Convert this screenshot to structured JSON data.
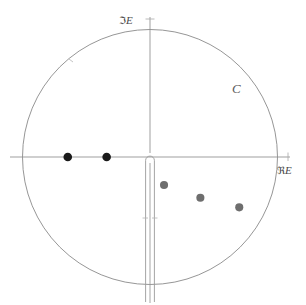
{
  "figure": {
    "background_color": "#ffffff",
    "line_color": "#8a8a8a",
    "axis_color": "#909090"
  },
  "labels": {
    "imaginary_axis": "E",
    "imaginary_axis_prefix": "ℑ",
    "real_axis": "E",
    "real_axis_prefix": "ℜ",
    "contour": "C"
  },
  "chart_data": {
    "type": "scatter",
    "xlabel": "ℜE",
    "ylabel": "ℑE",
    "xlim": [
      -1.1,
      1.1
    ],
    "ylim": [
      -1.1,
      1.1
    ],
    "grid": false,
    "legend": "none",
    "annotations": [
      {
        "text": "C",
        "x": 0.6,
        "y": 0.62,
        "note": "contour label near circle arc in upper right quadrant"
      },
      {
        "text": "ℑE",
        "x": -0.1,
        "y": 1.1,
        "note": "imaginary axis label at top"
      },
      {
        "text": "ℜE",
        "x": 1.12,
        "y": -0.12,
        "note": "real axis label at right"
      }
    ],
    "shapes": [
      {
        "kind": "circle",
        "name": "contour-C",
        "center": [
          0,
          0
        ],
        "radius": 1.0,
        "filled": false,
        "stroke": "#8a8a8a"
      },
      {
        "kind": "branch-cut",
        "name": "negative-imaginary-branch-cut",
        "from": [
          0,
          0
        ],
        "to": [
          0,
          -1.12
        ],
        "style": "narrow slit with rounded cap at origin, two parallel rails",
        "ticks_at": [
          -0.48
        ]
      },
      {
        "kind": "axis",
        "name": "real-axis",
        "from": [
          -1.1,
          0
        ],
        "to": [
          1.08,
          0
        ]
      },
      {
        "kind": "axis",
        "name": "imaginary-axis",
        "from": [
          0,
          -1.12
        ],
        "to": [
          0,
          1.06
        ]
      }
    ],
    "series": [
      {
        "name": "bound-state-poles",
        "marker": "filled circle",
        "color": "#1a1a1a",
        "size": 8,
        "points": [
          {
            "x": -0.645,
            "y": 0.0
          },
          {
            "x": -0.34,
            "y": 0.0
          }
        ]
      },
      {
        "name": "resonance-poles",
        "marker": "filled circle",
        "color": "#6e6e6e",
        "size": 7.5,
        "points": [
          {
            "x": 0.11,
            "y": -0.22
          },
          {
            "x": 0.395,
            "y": -0.32
          },
          {
            "x": 0.7,
            "y": -0.395
          }
        ]
      }
    ]
  }
}
